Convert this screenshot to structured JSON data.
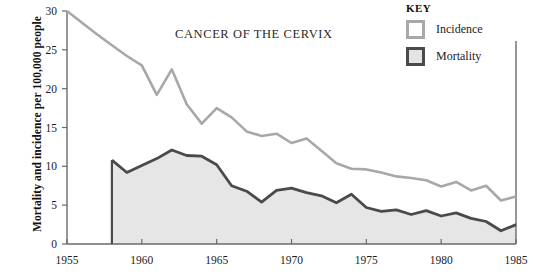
{
  "chart_data": {
    "type": "area",
    "title": "CANCER OF THE CERVIX",
    "xlabel": "",
    "ylabel": "Mortality and incidence per 100,000 people",
    "xlim": [
      1955,
      1985
    ],
    "ylim": [
      0,
      30
    ],
    "xticks": [
      1955,
      1960,
      1965,
      1970,
      1975,
      1980,
      1985
    ],
    "yticks": [
      0,
      5,
      10,
      15,
      20,
      25,
      30
    ],
    "grid": false,
    "legend_position": "top-right",
    "legend_title": "KEY",
    "colors": {
      "incidence": "#a8a8a8",
      "mortality": "#4a4a4a",
      "fill": "#e6e6e6",
      "axis": "#6a6a6a"
    },
    "series": [
      {
        "name": "Incidence",
        "x": [
          1955,
          1956,
          1957,
          1958,
          1959,
          1960,
          1961,
          1962,
          1963,
          1964,
          1965,
          1966,
          1967,
          1968,
          1969,
          1970,
          1971,
          1972,
          1973,
          1974,
          1975,
          1976,
          1977,
          1978,
          1979,
          1980,
          1981,
          1982,
          1983,
          1984,
          1985
        ],
        "values": [
          30.0,
          28.5,
          27.0,
          25.6,
          24.2,
          23.0,
          19.2,
          22.5,
          18.0,
          15.5,
          17.5,
          16.3,
          14.5,
          13.9,
          14.2,
          13.0,
          13.6,
          12.0,
          10.4,
          9.7,
          9.6,
          9.2,
          8.7,
          8.5,
          8.2,
          7.4,
          8.0,
          6.9,
          7.5,
          5.6,
          6.1
        ]
      },
      {
        "name": "Mortality",
        "x": [
          1958,
          1959,
          1960,
          1961,
          1962,
          1963,
          1964,
          1965,
          1966,
          1967,
          1968,
          1969,
          1970,
          1971,
          1972,
          1973,
          1974,
          1975,
          1976,
          1977,
          1978,
          1979,
          1980,
          1981,
          1982,
          1983,
          1984,
          1985
        ],
        "values": [
          10.8,
          9.2,
          10.1,
          11.0,
          12.1,
          11.4,
          11.3,
          10.2,
          7.5,
          6.8,
          5.4,
          6.9,
          7.2,
          6.6,
          6.2,
          5.3,
          6.4,
          4.7,
          4.2,
          4.4,
          3.8,
          4.3,
          3.6,
          4.0,
          3.3,
          2.9,
          1.7,
          2.5
        ]
      }
    ]
  },
  "axis": {
    "x_tick_labels": [
      "1955",
      "1960",
      "1965",
      "1970",
      "1975",
      "1980",
      "1985"
    ],
    "y_tick_labels": [
      "0",
      "5",
      "10",
      "15",
      "20",
      "25",
      "30"
    ]
  },
  "legend": {
    "title": "KEY",
    "items": [
      {
        "label": "Incidence",
        "swatch": "incidence-swatch"
      },
      {
        "label": "Mortality",
        "swatch": "mortality-swatch"
      }
    ]
  },
  "labels": {
    "title": "CANCER OF THE CERVIX",
    "ylabel": "Mortality and incidence per 100,000 people"
  }
}
